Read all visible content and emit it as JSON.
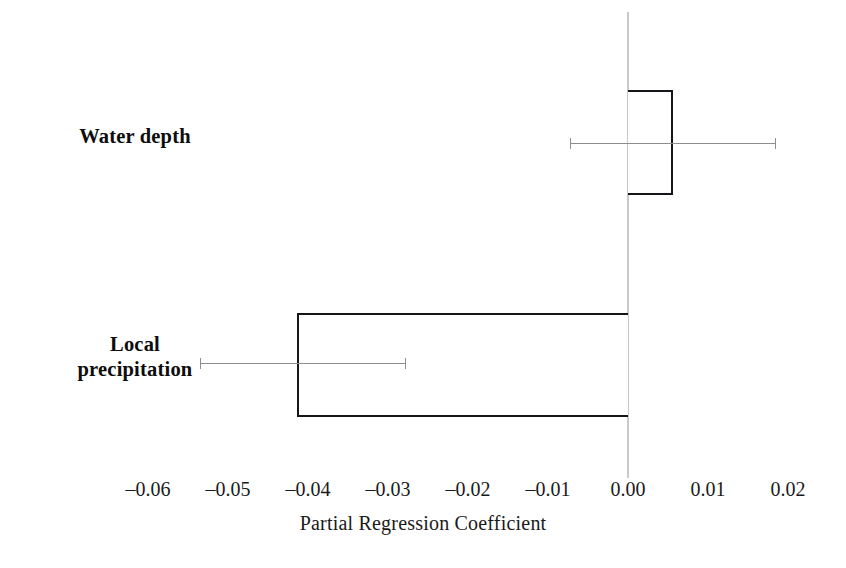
{
  "chart_data": {
    "type": "bar",
    "orientation": "horizontal",
    "title": "",
    "xlabel": "Partial Regression Coefficient",
    "ylabel": "",
    "categories": [
      "Water depth",
      "Local precipitation"
    ],
    "category_label_lines": [
      [
        "Water depth"
      ],
      [
        "Local",
        "precipitation"
      ]
    ],
    "values": [
      0.0056,
      -0.0414
    ],
    "errors_low": [
      -0.0072,
      -0.0535
    ],
    "errors_high": [
      0.0184,
      -0.0279
    ],
    "xlim": [
      -0.0675,
      0.0225
    ],
    "xticks": [
      -0.06,
      -0.05,
      -0.04,
      -0.03,
      -0.02,
      -0.01,
      0.0,
      0.01,
      0.02
    ],
    "xticklabels": [
      "–0.06",
      "–0.05",
      "–0.04",
      "–0.03",
      "–0.02",
      "–0.01",
      "0.00",
      "0.01",
      "0.02"
    ],
    "grid": false,
    "legend": null,
    "zero_line": 0.0,
    "bar_facecolor": "#ffffff",
    "bar_edgecolor": "#15161a",
    "error_color": "#8d8d8d",
    "zero_line_color": "#c9c9c9"
  },
  "axis": {
    "title": "Partial Regression Coefficient"
  }
}
